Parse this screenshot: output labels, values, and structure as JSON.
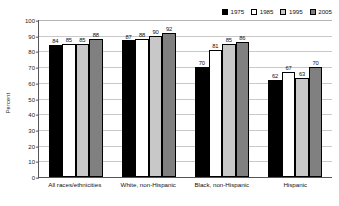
{
  "chart_data": {
    "type": "bar",
    "title": "",
    "subtitle": "",
    "xlabel": "",
    "ylabel": "Percent",
    "ylim": [
      0,
      100
    ],
    "ytick_step": 10,
    "yticks": [
      "100",
      "90",
      "80",
      "70",
      "60",
      "50",
      "40",
      "30",
      "20",
      "10",
      "0"
    ],
    "grid": true,
    "legend_position": "top-right",
    "categories": [
      "All races/ethnicities",
      "White, non-Hispanic",
      "Black, non-Hispanic",
      "Hispanic"
    ],
    "series": [
      {
        "name": "1975",
        "color": "#000000",
        "values": [
          84,
          87,
          70,
          62
        ]
      },
      {
        "name": "1985",
        "color": "#ffffff",
        "values": [
          85,
          88,
          81,
          67
        ]
      },
      {
        "name": "1995",
        "color": "#c8c8c8",
        "values": [
          85,
          90,
          85,
          63
        ]
      },
      {
        "name": "2005",
        "color": "#808080",
        "values": [
          88,
          92,
          86,
          70
        ]
      }
    ]
  }
}
